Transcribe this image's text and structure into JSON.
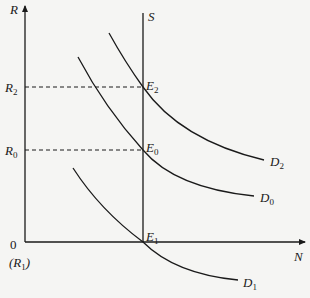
{
  "diagram": {
    "type": "supply-demand (money/labor market) equilibrium diagram",
    "axes": {
      "y_label": "R",
      "x_label": "N",
      "origin_label": "0",
      "origin_sublabel": "(R",
      "origin_sublabel_sub": "1",
      "origin_sublabel_close": ")"
    },
    "levels": [
      {
        "id": "R2",
        "label": "R",
        "sub": "2"
      },
      {
        "id": "R0",
        "label": "R",
        "sub": "0"
      }
    ],
    "supply": {
      "label": "S"
    },
    "equilibria": [
      {
        "id": "E2",
        "label": "E",
        "sub": "2"
      },
      {
        "id": "E0",
        "label": "E",
        "sub": "0"
      },
      {
        "id": "E1",
        "label": "E",
        "sub": "1"
      }
    ],
    "demand_curves": [
      {
        "id": "D2",
        "label": "D",
        "sub": "2"
      },
      {
        "id": "D0",
        "label": "D",
        "sub": "0"
      },
      {
        "id": "D1",
        "label": "D",
        "sub": "1"
      }
    ],
    "colors": {
      "line": "#1a1a1a",
      "background": "#f5f5f3"
    }
  }
}
